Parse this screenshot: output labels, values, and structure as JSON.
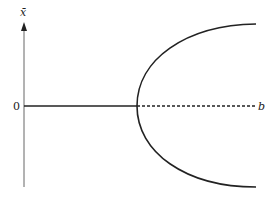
{
  "diagram": {
    "type": "pitchfork-bifurcation",
    "y_axis_label": "x̄",
    "x_axis_label": "b",
    "zero_label": "0",
    "stable_branch": "solid",
    "unstable_branch": "dashed",
    "line_color": "#222222"
  }
}
